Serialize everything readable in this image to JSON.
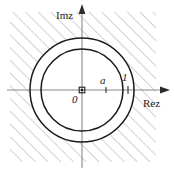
{
  "figure": {
    "type": "complex-plane-region",
    "labels": {
      "imaginary_axis": "Imz",
      "real_axis": "Rez",
      "origin": "0",
      "inner_radius_point": "a",
      "outer_radius_point": "1"
    },
    "colors": {
      "stroke": "#1a1a1a",
      "axis": "#808080",
      "hatch": "#9a9a9a",
      "background": "#ffffff"
    },
    "geometry": {
      "center_x": 82,
      "center_y": 90,
      "inner_circle_radius": 41,
      "outer_circle_radius": 52,
      "hatch_angle_deg": 45,
      "hatch_spacing_px": 9,
      "hatch_region": "exterior-of-outer-circle",
      "hatch_box": {
        "x": 10,
        "y": 12,
        "width": 146,
        "height": 150
      }
    },
    "axes": {
      "vertical": {
        "x": 82,
        "y_top": 6,
        "y_bottom": 168,
        "arrow": "up"
      },
      "horizontal": {
        "y": 90,
        "x_left": 8,
        "x_right": 168,
        "arrow": "right"
      }
    },
    "markers": {
      "origin_dot": {
        "x": 82,
        "y": 90,
        "shape": "square-dot"
      },
      "tick_a": {
        "x": 106,
        "y": 90
      },
      "tick_one": {
        "x": 128,
        "y": 90
      }
    }
  }
}
